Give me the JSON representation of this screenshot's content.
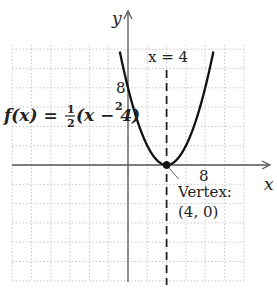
{
  "chart_data": {
    "type": "line",
    "title": "",
    "function_label": {
      "prefix": "f(x) = ",
      "frac_num": "1",
      "frac_den": "2",
      "suffix": "(x − 4)",
      "exponent": "2"
    },
    "series": [
      {
        "name": "f(x) = 1/2 (x - 4)^2",
        "expression": "0.5*(x-4)^2",
        "x": [
          -0.9,
          0,
          1,
          2,
          3,
          4,
          5,
          6,
          7,
          8,
          8.9
        ],
        "y": [
          12.0,
          8,
          4.5,
          2,
          0.5,
          0,
          0.5,
          2,
          4.5,
          8,
          12.0
        ]
      }
    ],
    "axis_of_symmetry": {
      "label": "x = 4",
      "x": 4,
      "style": "dashed"
    },
    "vertex": {
      "x": 4,
      "y": 0,
      "label_line1": "Vertex:",
      "label_line2": "(4, 0)"
    },
    "xlabel": "x",
    "ylabel": "y",
    "x_tick_labels": [
      {
        "value": 8,
        "label": "8"
      }
    ],
    "y_tick_labels": [
      {
        "value": 8,
        "label": "8"
      }
    ],
    "xlim": [
      -12,
      12
    ],
    "ylim": [
      -12,
      12
    ],
    "grid": {
      "on": true,
      "spacing": 2,
      "style": "dotted"
    },
    "legend": null
  },
  "colors": {
    "curve": "#111111",
    "axis": "#555555",
    "grid": "#c8c8c8",
    "dashed": "#222222",
    "text": "#222222"
  }
}
